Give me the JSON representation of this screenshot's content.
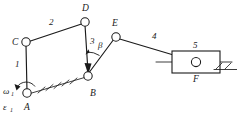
{
  "figure": {
    "type": "kinematic-linkage-mechanism-diagram",
    "title": "",
    "background_color": "#ffffff",
    "line_color": "#1a1a1a",
    "width": 237,
    "height": 117
  },
  "joints": [
    {
      "id": "A",
      "label": "A",
      "x": 27,
      "y": 93,
      "kind": "fixed-pivot",
      "label_x": 24,
      "label_y": 108
    },
    {
      "id": "C",
      "label": "C",
      "x": 26,
      "y": 42,
      "kind": "pin-joint",
      "label_x": 13,
      "label_y": 44
    },
    {
      "id": "D",
      "label": "D",
      "x": 85,
      "y": 22,
      "kind": "pin-joint",
      "label_x": 82,
      "label_y": 11
    },
    {
      "id": "B",
      "label": "B",
      "x": 88,
      "y": 76,
      "kind": "pin-joint",
      "label_x": 90,
      "label_y": 94
    },
    {
      "id": "E",
      "label": "E",
      "x": 116,
      "y": 37,
      "kind": "pin-joint",
      "label_x": 112,
      "label_y": 27
    },
    {
      "id": "F",
      "label": "F",
      "x": 196,
      "y": 62,
      "kind": "slider-pivot",
      "label_x": 193,
      "label_y": 80
    }
  ],
  "links": [
    {
      "id": "1",
      "label": "1",
      "from": "A",
      "to": "C",
      "label_x": 17,
      "label_y": 65
    },
    {
      "id": "2",
      "label": "2",
      "from": "C",
      "to": "D",
      "label_x": 50,
      "label_y": 24
    },
    {
      "id": "3",
      "label": "3",
      "from": "D",
      "to": "B",
      "label_x": 90,
      "label_y": 44
    },
    {
      "id": "4",
      "label": "4",
      "from": "E",
      "to": "F",
      "label_x": 153,
      "label_y": 38
    },
    {
      "id": "5",
      "label": "5",
      "from": "F",
      "to": "F",
      "label_x": 196,
      "label_y": 48
    }
  ],
  "angles": [
    {
      "id": "beta",
      "label": "β",
      "at_joint": "B",
      "label_x": 99,
      "label_y": 47
    }
  ],
  "motion_labels": [
    {
      "id": "omega1",
      "symbol": "ω",
      "subscript": "1",
      "x": 4,
      "y": 92,
      "meaning": "angular-velocity-link-1"
    },
    {
      "id": "eps1",
      "symbol": "ε",
      "subscript": "1",
      "x": 4,
      "y": 108,
      "meaning": "angular-acceleration-link-1"
    }
  ],
  "ground": [
    {
      "id": "ground-A-B",
      "kind": "inclined-hatched-ground",
      "from_x": 30,
      "from_y": 93,
      "to_x": 86,
      "to_y": 77
    },
    {
      "id": "ground-slider",
      "kind": "horizontal-hatched-ground",
      "from_x": 214,
      "from_y": 69,
      "to_x": 237,
      "to_y": 69
    }
  ],
  "slider": {
    "id": "slider-5",
    "label": "5",
    "rect_x": 172,
    "rect_y": 51,
    "rect_w": 48,
    "rect_h": 22,
    "guide_from_x": 156,
    "guide_to_x": 232,
    "guide_y": 62
  }
}
